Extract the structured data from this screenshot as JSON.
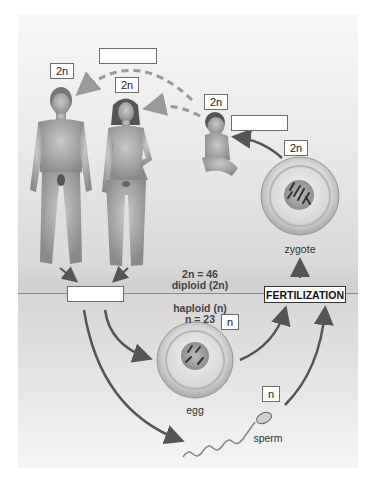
{
  "labels": {
    "man_ploidy": "2n",
    "woman_ploidy": "2n",
    "baby_ploidy": "2n",
    "zygote_ploidy": "2n",
    "egg_ploidy": "n",
    "sperm_ploidy": "n"
  },
  "captions": {
    "zygote": "zygote",
    "egg": "egg",
    "sperm": "sperm",
    "fertilization": "FERTILIZATION"
  },
  "info": {
    "diploid_count": "2n = 46",
    "diploid_label": "diploid (2n)",
    "haploid_label": "haploid (n)",
    "haploid_count": "n = 23"
  },
  "blank_labels": [
    "",
    "",
    ""
  ],
  "colors": {
    "arrow_solid": "#555555",
    "arrow_dashed": "#9a9a9a",
    "background": "#d9d9d9"
  }
}
